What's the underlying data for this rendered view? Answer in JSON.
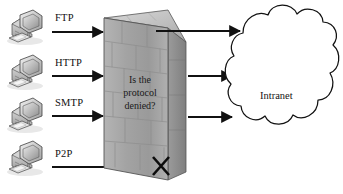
{
  "diagram": {
    "background_color": "#ffffff",
    "line_color": "#111111"
  },
  "hosts": [
    {
      "id": "host-ftp",
      "icon": "desktop-computer-icon",
      "protocol": "FTP",
      "allowed": true
    },
    {
      "id": "host-http",
      "icon": "desktop-computer-icon",
      "protocol": "HTTP",
      "allowed": true
    },
    {
      "id": "host-smtp",
      "icon": "desktop-computer-icon",
      "protocol": "SMTP",
      "allowed": true
    },
    {
      "id": "host-p2p",
      "icon": "desktop-computer-icon",
      "protocol": "P2P",
      "allowed": false
    }
  ],
  "firewall": {
    "name": "brick-wall-firewall",
    "question_line1": "Is the",
    "question_line2": "protocol",
    "question_line3": "denied?",
    "face_color": "#a9a9a9",
    "top_color": "#c9c9c9",
    "side_color": "#8f8f8f"
  },
  "blocked_marker": {
    "name": "block-x-marker",
    "glyph": "X",
    "applies_to": "P2P"
  },
  "network": {
    "name": "intranet-cloud",
    "label": "Intranet"
  },
  "flows": {
    "allowed_count": 3,
    "blocked_count": 1
  }
}
